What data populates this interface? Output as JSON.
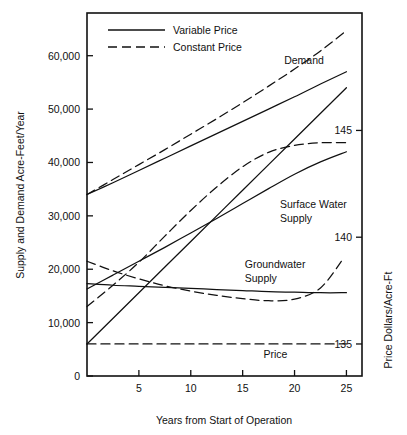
{
  "chart_data": {
    "type": "line",
    "title": "",
    "xlabel": "Years from Start of Operation",
    "ylabel": "Supply and Demand Acre-Feet/Year",
    "y2label": "Price Dollars/Acre-Ft",
    "xlim": [
      0,
      26.5
    ],
    "ylim": [
      0,
      68000
    ],
    "y2lim": [
      133.5,
      150.5
    ],
    "grid": false,
    "legend_position": "top-left-inside",
    "xticks": [
      5,
      10,
      15,
      20,
      25
    ],
    "xtick_labels": [
      "5",
      "10",
      "15",
      "20",
      "25"
    ],
    "yticks": [
      0,
      10000,
      20000,
      30000,
      40000,
      50000,
      60000
    ],
    "ytick_labels": [
      "0",
      "10,000",
      "20,000",
      "30,000",
      "40,000",
      "50,000",
      "60,000"
    ],
    "y2ticks": [
      135,
      140,
      145
    ],
    "y2tick_labels": [
      "135",
      "140",
      "145"
    ],
    "legend": [
      {
        "name": "Variable Price",
        "style": "solid"
      },
      {
        "name": "Constant Price",
        "style": "dashed"
      }
    ],
    "annotations": [
      {
        "text": "Demand",
        "x": 19.0,
        "y": 58500
      },
      {
        "text": "Surface Water",
        "x": 18.6,
        "y": 31500
      },
      {
        "text": "Supply",
        "x": 18.6,
        "y": 28800
      },
      {
        "text": "Groundwater",
        "x": 15.2,
        "y": 20300
      },
      {
        "text": "Supply",
        "x": 15.2,
        "y": 17700
      },
      {
        "text": "Price",
        "x": 17.0,
        "y": 3300
      }
    ],
    "series": [
      {
        "name": "Demand (Variable Price)",
        "style": "solid",
        "axis": "left",
        "x": [
          0,
          2.5,
          5,
          7.5,
          10,
          12.5,
          15,
          17.5,
          20,
          22.5,
          25
        ],
        "values": [
          34000,
          36200,
          38500,
          40800,
          43100,
          45400,
          47700,
          50000,
          52300,
          54700,
          57000
        ]
      },
      {
        "name": "Demand (Constant Price)",
        "style": "dashed",
        "axis": "left",
        "x": [
          0,
          2.5,
          5,
          7.5,
          10,
          12.5,
          15,
          17.5,
          20,
          22.5,
          25
        ],
        "values": [
          34000,
          36800,
          39600,
          42400,
          45300,
          48200,
          51200,
          54300,
          57500,
          60900,
          64700
        ]
      },
      {
        "name": "Surface Water Supply (Variable Price)",
        "style": "solid",
        "axis": "left",
        "x": [
          0,
          2.5,
          5,
          7.5,
          10,
          12.5,
          15,
          17.5,
          20,
          22.5,
          25
        ],
        "values": [
          16300,
          18900,
          21500,
          24100,
          26800,
          29500,
          32300,
          35100,
          37800,
          40100,
          42000
        ]
      },
      {
        "name": "Surface Water Supply (Constant Price)",
        "style": "dashed",
        "axis": "left",
        "x": [
          0,
          2.5,
          5,
          7.5,
          10,
          12.5,
          15,
          17.5,
          20,
          22.5,
          25
        ],
        "values": [
          13000,
          17000,
          21300,
          26200,
          31000,
          35400,
          39200,
          41900,
          43200,
          43700,
          43700
        ]
      },
      {
        "name": "Groundwater Supply (Variable Price)",
        "style": "solid",
        "axis": "left",
        "x": [
          0,
          2.5,
          5,
          7.5,
          10,
          12.5,
          15,
          17.5,
          20,
          22.5,
          25
        ],
        "values": [
          17300,
          17000,
          16800,
          16600,
          16400,
          16200,
          16000,
          15800,
          15700,
          15600,
          15600
        ]
      },
      {
        "name": "Groundwater Supply (Constant Price)",
        "style": "dashed",
        "axis": "left",
        "x": [
          0,
          2.5,
          5,
          7.5,
          10,
          12.5,
          15,
          17.5,
          20,
          22.5,
          24.7
        ],
        "values": [
          21500,
          19700,
          18200,
          16900,
          15900,
          15100,
          14500,
          14100,
          14400,
          16500,
          22000
        ]
      },
      {
        "name": "Price (Variable Price)",
        "style": "solid",
        "axis": "right",
        "x": [
          0,
          5,
          10,
          15,
          20,
          25
        ],
        "values": [
          135.0,
          137.4,
          139.8,
          142.2,
          144.6,
          147.0
        ]
      },
      {
        "name": "Price (Constant Price)",
        "style": "dashed",
        "axis": "right",
        "x": [
          0,
          5,
          10,
          15,
          20,
          25
        ],
        "values": [
          135.0,
          135.0,
          135.0,
          135.0,
          135.0,
          135.0
        ]
      }
    ]
  }
}
